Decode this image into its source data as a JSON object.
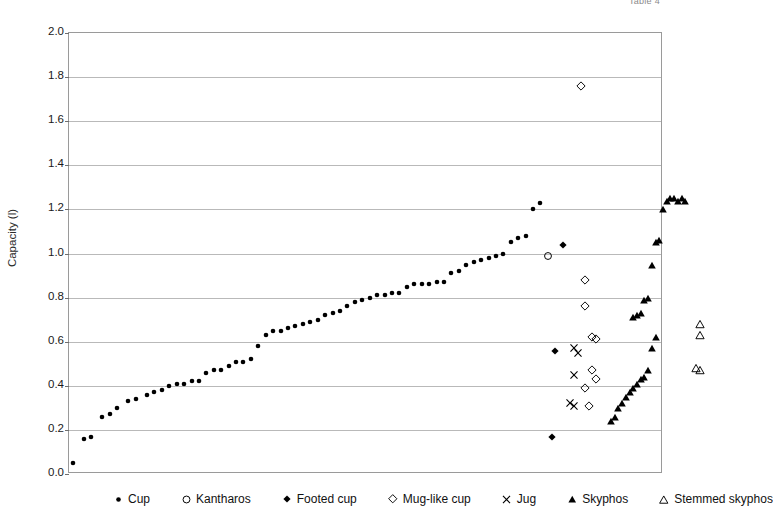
{
  "top_caption": "Table 4",
  "chart_data": {
    "type": "scatter",
    "title": "",
    "xlabel": "",
    "ylabel": "Capacity (l)",
    "ylim": [
      0.0,
      2.0
    ],
    "ytick_labels": [
      "0.0",
      "0.2",
      "0.4",
      "0.6",
      "0.8",
      "1.0",
      "1.2",
      "1.4",
      "1.6",
      "1.8",
      "2.0"
    ],
    "ytick_values": [
      0.0,
      0.2,
      0.4,
      0.6,
      0.8,
      1.0,
      1.2,
      1.4,
      1.6,
      1.8,
      2.0
    ],
    "xlim": [
      0,
      160
    ],
    "xtick_labels": [],
    "grid": "horizontal",
    "legend_position": "bottom",
    "marker_color": "#000000",
    "series": [
      {
        "name": "Cup",
        "marker": "filled-circle",
        "x": [
          1,
          4,
          6,
          9,
          11,
          13,
          16,
          18,
          21,
          23,
          25,
          27,
          29,
          31,
          33,
          35,
          37,
          39,
          41,
          43,
          45,
          47,
          49,
          51,
          53,
          55,
          57,
          59,
          61,
          63,
          65,
          67,
          69,
          71,
          73,
          75,
          77,
          79,
          81,
          83,
          85,
          87,
          89,
          91,
          93,
          95,
          97,
          99,
          101,
          103,
          105,
          107,
          109,
          111,
          113,
          115,
          117,
          119,
          121,
          123,
          125,
          127
        ],
        "y": [
          0.05,
          0.16,
          0.17,
          0.26,
          0.27,
          0.3,
          0.33,
          0.34,
          0.36,
          0.37,
          0.38,
          0.4,
          0.41,
          0.41,
          0.42,
          0.42,
          0.46,
          0.47,
          0.47,
          0.49,
          0.51,
          0.51,
          0.52,
          0.58,
          0.63,
          0.65,
          0.65,
          0.66,
          0.67,
          0.68,
          0.69,
          0.7,
          0.72,
          0.73,
          0.74,
          0.76,
          0.78,
          0.79,
          0.8,
          0.81,
          0.81,
          0.82,
          0.82,
          0.85,
          0.86,
          0.86,
          0.86,
          0.87,
          0.87,
          0.91,
          0.92,
          0.95,
          0.96,
          0.97,
          0.98,
          0.99,
          1.0,
          1.05,
          1.07,
          1.08,
          1.2,
          1.23
        ]
      },
      {
        "name": "Kantharos",
        "marker": "open-circle",
        "x": [
          129
        ],
        "y": [
          0.99
        ]
      },
      {
        "name": "Footed cup",
        "marker": "filled-diamond",
        "x": [
          133,
          131,
          130
        ],
        "y": [
          1.04,
          0.56,
          0.17
        ]
      },
      {
        "name": "Mug-like cup",
        "marker": "open-diamond",
        "x": [
          138,
          139,
          139,
          141,
          142,
          141,
          142,
          139,
          140
        ],
        "y": [
          1.76,
          0.88,
          0.76,
          0.62,
          0.61,
          0.47,
          0.43,
          0.39,
          0.31
        ]
      },
      {
        "name": "Jug",
        "marker": "cross-x",
        "x": [
          136,
          137,
          136,
          135,
          136
        ],
        "y": [
          0.57,
          0.55,
          0.45,
          0.32,
          0.31
        ]
      },
      {
        "name": "Skyphos",
        "marker": "filled-triangle",
        "x": [
          146,
          147,
          148,
          149,
          150,
          151,
          152,
          153,
          154,
          155,
          156,
          157,
          158,
          152,
          153,
          154,
          155,
          156,
          157,
          158,
          159,
          160,
          161,
          162,
          163,
          164,
          165,
          166
        ],
        "y": [
          0.24,
          0.26,
          0.3,
          0.32,
          0.35,
          0.37,
          0.39,
          0.41,
          0.43,
          0.44,
          0.47,
          0.57,
          0.62,
          0.71,
          0.72,
          0.73,
          0.79,
          0.8,
          0.95,
          1.05,
          1.06,
          1.2,
          1.24,
          1.25,
          1.25,
          1.24,
          1.25,
          1.24
        ]
      },
      {
        "name": "Stemmed skyphos",
        "marker": "open-triangle",
        "x": [
          170,
          170,
          169,
          170
        ],
        "y": [
          0.68,
          0.63,
          0.48,
          0.47
        ]
      }
    ]
  },
  "legend": {
    "items": [
      {
        "label": "Cup",
        "marker": "filled-circle"
      },
      {
        "label": "Kantharos",
        "marker": "open-circle"
      },
      {
        "label": "Footed cup",
        "marker": "filled-diamond"
      },
      {
        "label": "Mug-like cup",
        "marker": "open-diamond"
      },
      {
        "label": "Jug",
        "marker": "cross-x"
      },
      {
        "label": "Skyphos",
        "marker": "filled-triangle"
      },
      {
        "label": "Stemmed skyphos",
        "marker": "open-triangle"
      }
    ]
  }
}
